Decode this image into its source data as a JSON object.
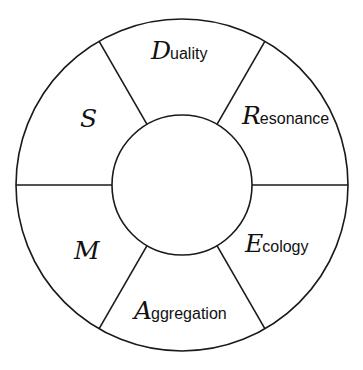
{
  "diagram": {
    "type": "ring-wheel",
    "center": {
      "x": 182,
      "y": 185
    },
    "outer_radius": 166,
    "inner_radius": 70,
    "stroke_color": "#1a1a1a",
    "background": "#ffffff",
    "divider_angles_deg": [
      0,
      60,
      120,
      180,
      240,
      300
    ],
    "center_label": "",
    "segments": [
      {
        "id": "duality",
        "initial": "D",
        "rest": "uality",
        "position": "top"
      },
      {
        "id": "resonance",
        "initial": "R",
        "rest": "esonance",
        "position": "upper-right"
      },
      {
        "id": "ecology",
        "initial": "E",
        "rest": "cology",
        "position": "lower-right"
      },
      {
        "id": "aggregation",
        "initial": "A",
        "rest": "ggregation",
        "position": "bottom"
      },
      {
        "id": "m",
        "initial": "M",
        "rest": "",
        "position": "lower-left"
      },
      {
        "id": "s",
        "initial": "S",
        "rest": "",
        "position": "upper-left"
      }
    ]
  }
}
